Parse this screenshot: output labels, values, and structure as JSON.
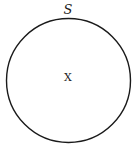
{
  "figure": {
    "type": "set-diagram",
    "background_color": "#ffffff",
    "stroke_color": "#1a1a1a",
    "text_color": "#1a1a1a"
  },
  "set": {
    "shape": "circle",
    "label": "S",
    "label_position": "top-outside",
    "center_x": 68.5,
    "center_y": 80.5,
    "radius": 62,
    "stroke_width": 1.4
  },
  "element": {
    "label": "X",
    "center_x": 68,
    "center_y": 77
  },
  "labels": {
    "set_label": "S",
    "element_label": "X"
  }
}
